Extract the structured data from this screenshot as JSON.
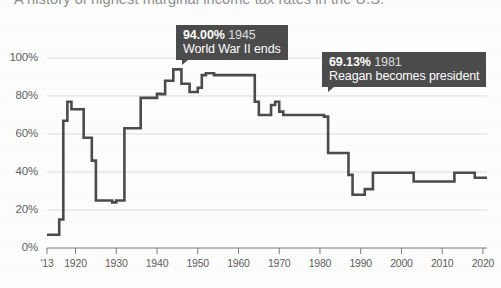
{
  "headline": {
    "text": "A history of highest marginal income tax rates in the U.S."
  },
  "chart_data": {
    "type": "line",
    "title": "A history of highest marginal income tax rates in the U.S.",
    "xlabel": "",
    "ylabel": "",
    "xlim": [
      1913,
      2021
    ],
    "ylim": [
      0,
      1.0
    ],
    "grid": true,
    "legend": "none",
    "line_color": "#4b4b4b",
    "ytick_labels": [
      "0%",
      "20%",
      "40%",
      "60%",
      "80%",
      "100%"
    ],
    "ytick_values": [
      0,
      20,
      40,
      60,
      80,
      100
    ],
    "xtick_labels": [
      "'13",
      "1920",
      "1930",
      "1940",
      "1950",
      "1960",
      "1970",
      "1980",
      "1990",
      "2000",
      "2010",
      "2020"
    ],
    "xtick_values": [
      1913,
      1920,
      1930,
      1940,
      1950,
      1960,
      1970,
      1980,
      1990,
      2000,
      2010,
      2020
    ],
    "x": [
      1913,
      1915,
      1916,
      1917,
      1918,
      1919,
      1921,
      1922,
      1924,
      1925,
      1929,
      1930,
      1932,
      1936,
      1940,
      1941,
      1942,
      1944,
      1945,
      1946,
      1948,
      1950,
      1951,
      1952,
      1954,
      1964,
      1965,
      1968,
      1969,
      1970,
      1971,
      1981,
      1982,
      1987,
      1988,
      1991,
      1993,
      2003,
      2013,
      2018,
      2020
    ],
    "values": [
      7,
      7,
      15,
      67,
      77,
      73,
      73,
      58,
      46,
      25,
      24,
      25,
      63,
      79,
      81.1,
      81,
      88,
      94,
      94,
      86.45,
      82.13,
      84.36,
      91,
      92,
      91,
      77,
      70,
      75.25,
      77,
      71.75,
      70,
      69.13,
      50,
      38.5,
      28,
      31,
      39.6,
      35,
      39.6,
      37,
      37
    ],
    "annotations": [
      {
        "id": "wwii",
        "value": "94.00%",
        "year": "1945",
        "description": "World War II ends",
        "point_x": 1945,
        "point_y": 94
      },
      {
        "id": "reagan",
        "value": "69.13%",
        "year": "1981",
        "description": "Reagan becomes president",
        "point_x": 1981,
        "point_y": 69.13
      }
    ]
  }
}
